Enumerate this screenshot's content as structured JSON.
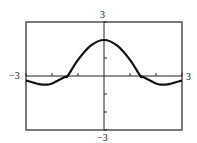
{
  "chart_data": {
    "type": "line",
    "title": "",
    "xlabel": "",
    "ylabel": "",
    "xlim": [
      -3,
      3
    ],
    "ylim": [
      -3,
      3
    ],
    "xtick_step": 1,
    "ytick_step": 1,
    "grid": false,
    "tick_labels": {
      "xmin": "−3",
      "xmax": "3",
      "ymin": "−3",
      "ymax": "3"
    },
    "series": [
      {
        "name": "f(x)",
        "x": [
          -3,
          -2.5,
          -2.2,
          -2,
          -1.5,
          -1.4,
          -1,
          -0.5,
          0,
          0.5,
          1,
          1.4,
          1.5,
          2,
          2.2,
          2.5,
          3
        ],
        "y": [
          -0.25,
          -0.45,
          -0.48,
          -0.42,
          -0.05,
          0,
          0.9,
          1.7,
          2,
          1.7,
          0.9,
          0,
          -0.05,
          -0.42,
          -0.48,
          -0.45,
          -0.25
        ]
      }
    ]
  }
}
